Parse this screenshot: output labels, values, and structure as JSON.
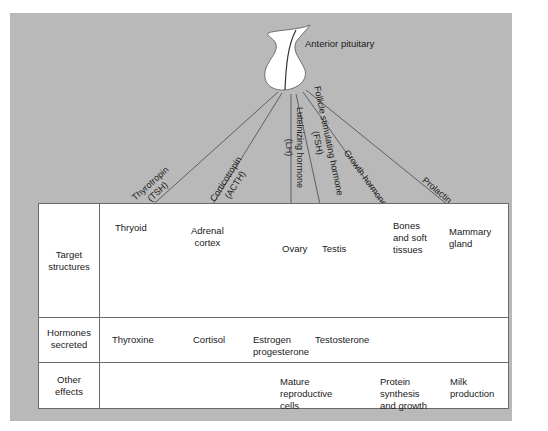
{
  "source": {
    "label": "Anterior pituitary"
  },
  "hormones": [
    {
      "name": "Thyrotropin",
      "abbr": "(TSH)"
    },
    {
      "name": "Corticotropin",
      "abbr": "(ACTH)"
    },
    {
      "name": "Luteinizing hormone",
      "abbr": "(LH)"
    },
    {
      "name": "Follicle stimulating hormone",
      "abbr": "(FSH)"
    },
    {
      "name": "Growth hormone",
      "abbr": ""
    },
    {
      "name": "Prolactin",
      "abbr": ""
    }
  ],
  "table": {
    "row_labels": {
      "target": [
        "Target",
        "structures"
      ],
      "secreted": [
        "Hormones",
        "secreted"
      ],
      "effects": [
        "Other",
        "effects"
      ]
    },
    "targets": {
      "thyroid": "Thryoid",
      "adrenal": [
        "Adrenal",
        "cortex"
      ],
      "ovary": "Ovary",
      "testis": "Testis",
      "bones": [
        "Bones",
        "and soft",
        "tissues"
      ],
      "mammary": [
        "Mammary",
        "gland"
      ]
    },
    "secreted": {
      "thyroxine": "Thyroxine",
      "cortisol": "Cortisol",
      "estrogen": [
        "Estrogen",
        "progesterone"
      ],
      "testosterone": "Testosterone"
    },
    "effects": {
      "reproductive": [
        "Mature",
        "reproductive",
        "cells"
      ],
      "protein": [
        "Protein",
        "synthesis",
        "and growth"
      ],
      "milk": [
        "Milk",
        "production"
      ]
    }
  },
  "colors": {
    "panel": "#b9b9b9",
    "table": "#ffffff",
    "line": "#555555"
  }
}
